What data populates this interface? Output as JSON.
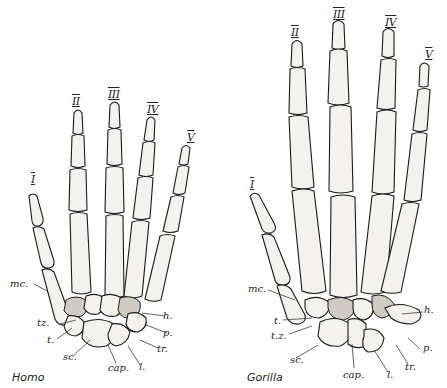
{
  "figure": {
    "panels": [
      {
        "id": "homo",
        "caption": "Homo",
        "finger_labels": [
          "I",
          "II",
          "III",
          "IV",
          "V"
        ],
        "bone_labels": [
          "mc.",
          "tz.",
          "t.",
          "sc.",
          "cap.",
          "l.",
          "tr.",
          "p.",
          "h."
        ]
      },
      {
        "id": "gorilla",
        "caption": "Gorilla",
        "finger_labels": [
          "I",
          "II",
          "III",
          "IV",
          "V"
        ],
        "bone_labels": [
          "mc.",
          "t.",
          "t.z.",
          "sc.",
          "cap.",
          "l.",
          "tr.",
          "p.",
          "h."
        ]
      }
    ]
  }
}
